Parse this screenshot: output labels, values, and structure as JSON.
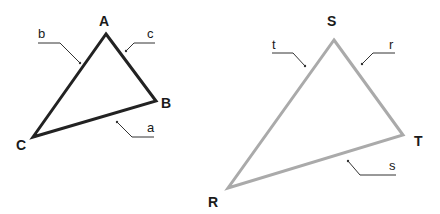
{
  "diagram": {
    "triangle_1": {
      "stroke_color": "#222222",
      "vertices": [
        {
          "label": "A",
          "x": 106,
          "y": 34
        },
        {
          "label": "B",
          "x": 156,
          "y": 101
        },
        {
          "label": "C",
          "x": 33,
          "y": 137
        }
      ],
      "sides": [
        {
          "label": "a",
          "between": "B-C"
        },
        {
          "label": "b",
          "between": "C-A"
        },
        {
          "label": "c",
          "between": "A-B"
        }
      ]
    },
    "triangle_2": {
      "stroke_color": "#aaaaaa",
      "vertices": [
        {
          "label": "S",
          "x": 334,
          "y": 40
        },
        {
          "label": "T",
          "x": 403,
          "y": 135
        },
        {
          "label": "R",
          "x": 228,
          "y": 188
        }
      ],
      "sides": [
        {
          "label": "r",
          "between": "S-T"
        },
        {
          "label": "s",
          "between": "T-R"
        },
        {
          "label": "t",
          "between": "R-S"
        }
      ]
    }
  }
}
